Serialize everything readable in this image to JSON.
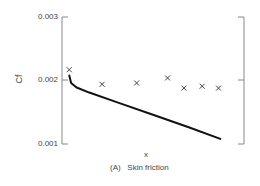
{
  "chart_data": {
    "type": "scatter",
    "title": "",
    "caption": "(A)   Skin friction",
    "xlabel": "x",
    "ylabel": "Cf",
    "ylim": [
      0.001,
      0.003
    ],
    "yticks": [
      "0.003",
      "0.002",
      "0.001"
    ],
    "grid": false,
    "legend": null,
    "series": [
      {
        "name": "measured",
        "kind": "scatter",
        "marker": "x",
        "x": [
          0.04,
          0.22,
          0.41,
          0.58,
          0.67,
          0.77,
          0.86
        ],
        "values": [
          0.00217,
          0.00194,
          0.00196,
          0.00204,
          0.00188,
          0.00191,
          0.00188
        ]
      },
      {
        "name": "predicted",
        "kind": "line",
        "x": [
          0.04,
          0.05,
          0.08,
          0.15,
          0.3,
          0.5,
          0.7,
          0.87
        ],
        "values": [
          0.00208,
          0.00196,
          0.00189,
          0.00181,
          0.00166,
          0.00146,
          0.00126,
          0.00108
        ]
      }
    ]
  },
  "labels": {
    "y_tick_top": "0.003",
    "y_tick_mid": "0.002",
    "y_tick_bottom": "0.001",
    "y_axis": "Cf",
    "x_axis": "x",
    "caption": "(A)   Skin friction"
  },
  "colors": {
    "axis": "#888888",
    "line": "#111111",
    "marker": "#444444"
  }
}
